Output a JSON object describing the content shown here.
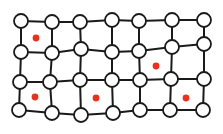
{
  "diagram": {
    "type": "grid-graph",
    "colors": {
      "background": "#ffffff",
      "edge": "#1a1a1a",
      "node_fill": "#ffffff",
      "node_stroke": "#1a1a1a",
      "marker": "#e8321e"
    },
    "rows": 4,
    "cols": 7,
    "node_radius": 7,
    "nodes": [
      [
        [
          21,
          21
        ],
        [
          52,
          22
        ],
        [
          80,
          22
        ],
        [
          112,
          20
        ],
        [
          139,
          21
        ],
        [
          172,
          20
        ],
        [
          204,
          20
        ]
      ],
      [
        [
          21,
          52
        ],
        [
          52,
          53
        ],
        [
          81,
          49
        ],
        [
          112,
          52
        ],
        [
          139,
          51
        ],
        [
          172,
          47
        ],
        [
          204,
          44
        ]
      ],
      [
        [
          20,
          82
        ],
        [
          50,
          82
        ],
        [
          80,
          80
        ],
        [
          112,
          80
        ],
        [
          140,
          80
        ],
        [
          171,
          79
        ],
        [
          204,
          79
        ]
      ],
      [
        [
          19,
          110
        ],
        [
          52,
          113
        ],
        [
          81,
          115
        ],
        [
          113,
          113
        ],
        [
          140,
          110
        ],
        [
          170,
          110
        ],
        [
          203,
          110
        ]
      ]
    ],
    "markers": [
      {
        "x": 36,
        "y": 38
      },
      {
        "x": 156,
        "y": 66
      },
      {
        "x": 35,
        "y": 97
      },
      {
        "x": 96,
        "y": 98
      },
      {
        "x": 186,
        "y": 98
      }
    ]
  }
}
